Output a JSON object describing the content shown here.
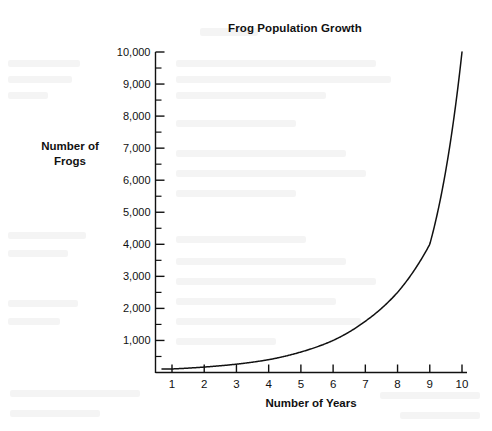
{
  "chart_data": {
    "type": "line",
    "title": "Frog Population Growth",
    "xlabel": "Number of Years",
    "ylabel_line1": "Number of",
    "ylabel_line2": "Frogs",
    "ylabel": "Number of Frogs",
    "x": [
      1,
      2,
      3,
      4,
      5,
      6,
      7,
      8,
      9,
      10
    ],
    "values": [
      110,
      170,
      260,
      400,
      640,
      1000,
      1600,
      2500,
      4000,
      10000
    ],
    "series": [
      {
        "name": "Frog population",
        "values": [
          110,
          170,
          260,
          400,
          640,
          1000,
          1600,
          2500,
          4000,
          10000
        ]
      }
    ],
    "xlim": [
      0.5,
      10
    ],
    "ylim": [
      0,
      10000
    ],
    "x_tick_labels": [
      "1",
      "2",
      "3",
      "4",
      "5",
      "6",
      "7",
      "8",
      "9",
      "10"
    ],
    "y_tick_labels": [
      "1,000",
      "2,000",
      "3,000",
      "4,000",
      "5,000",
      "6,000",
      "7,000",
      "8,000",
      "9,000",
      "10,000"
    ],
    "y_tick_values": [
      1000,
      2000,
      3000,
      4000,
      5000,
      6000,
      7000,
      8000,
      9000,
      10000
    ],
    "y_minor_tick_interval": 500,
    "grid": false,
    "legend": "none",
    "line_color": "#000000"
  },
  "axis_titles": {
    "x": "Number of Years",
    "y_line1": "Number of",
    "y_line2": "Frogs"
  },
  "title": "Frog Population Growth"
}
